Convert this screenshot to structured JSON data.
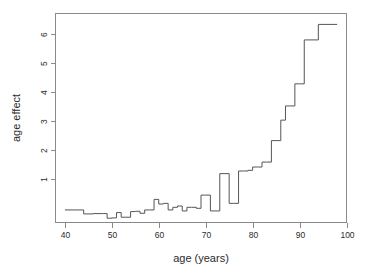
{
  "chart_data": {
    "type": "line",
    "subtype": "step",
    "title": "",
    "xlabel": "age (years)",
    "ylabel": "age effect",
    "xlim": [
      38,
      100
    ],
    "ylim": [
      0.62,
      6.95
    ],
    "xticks": [
      40,
      50,
      60,
      70,
      80,
      90,
      100
    ],
    "xtick_labels": [
      "40",
      "50",
      "60",
      "70",
      "80",
      "90",
      "100"
    ],
    "yticks": [
      1,
      2,
      3,
      4,
      5,
      6
    ],
    "ytick_labels": [
      "1",
      "2",
      "3",
      "4",
      "5",
      "6"
    ],
    "grid": false,
    "legend": null,
    "legend_position": "none",
    "line_color": "#555555",
    "frame_color": "#8a8a8a",
    "background_color": "#ffffff",
    "step_direction": "post",
    "x": [
      40,
      43,
      44,
      46,
      48,
      49,
      50,
      51,
      52,
      53,
      54,
      55,
      56,
      57,
      58,
      59,
      60,
      61,
      62,
      63,
      64,
      65,
      66,
      67,
      68,
      69,
      70,
      71,
      72,
      73,
      75,
      76,
      77,
      78,
      79,
      80,
      81,
      82,
      83,
      84,
      85,
      86,
      87,
      88,
      89,
      90,
      91,
      92,
      94,
      98
    ],
    "y": [
      1.0,
      1.0,
      0.88,
      0.89,
      0.89,
      0.75,
      0.76,
      0.92,
      0.78,
      0.78,
      0.95,
      0.96,
      0.9,
      1.0,
      1.0,
      1.32,
      1.18,
      1.2,
      1.0,
      1.08,
      1.12,
      0.97,
      1.08,
      1.08,
      1.05,
      1.45,
      1.45,
      0.97,
      0.97,
      2.1,
      1.2,
      1.2,
      2.18,
      2.18,
      2.2,
      2.3,
      2.3,
      2.45,
      2.45,
      3.1,
      3.1,
      3.72,
      4.15,
      4.15,
      4.82,
      4.82,
      6.15,
      6.15,
      6.62,
      6.62
    ]
  }
}
